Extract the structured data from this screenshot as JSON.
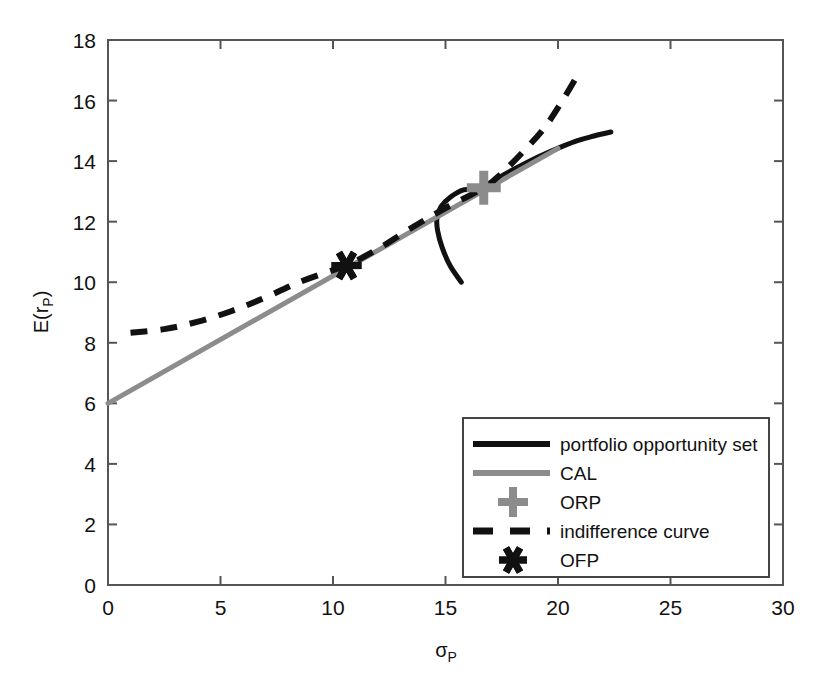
{
  "chart_data": {
    "type": "line",
    "title": "",
    "xlabel": "σP",
    "ylabel": "E(rP)",
    "xlim": [
      0,
      30
    ],
    "ylim": [
      0,
      18
    ],
    "xticks": [
      0,
      5,
      10,
      15,
      20,
      25,
      30
    ],
    "yticks": [
      0,
      2,
      4,
      6,
      8,
      10,
      12,
      14,
      16,
      18
    ],
    "xtick_labels": [
      "0",
      "5",
      "10",
      "15",
      "20",
      "25",
      "30"
    ],
    "ytick_labels": [
      "0",
      "2",
      "4",
      "6",
      "8",
      "10",
      "12",
      "14",
      "16",
      "18"
    ],
    "grid": false,
    "legend_position": "lower right",
    "colors": {
      "portfolio_opportunity_set": "#111111",
      "cal": "#8c8c8c",
      "orp": "#8c8c8c",
      "indifference_curve": "#111111",
      "ofp": "#111111",
      "axes": "#444444",
      "background": "#ffffff"
    },
    "series": [
      {
        "name": "portfolio opportunity set",
        "style": "solid",
        "color": "#111111",
        "points": [
          [
            15.7,
            10.0
          ],
          [
            15.2,
            10.55
          ],
          [
            14.85,
            11.15
          ],
          [
            14.65,
            11.7
          ],
          [
            14.62,
            12.12
          ],
          [
            14.8,
            12.5
          ],
          [
            15.2,
            12.8
          ],
          [
            15.8,
            13.05
          ],
          [
            16.7,
            13.12
          ],
          [
            17.6,
            13.55
          ],
          [
            18.6,
            13.95
          ],
          [
            19.7,
            14.33
          ],
          [
            20.8,
            14.66
          ],
          [
            21.6,
            14.83
          ],
          [
            22.35,
            14.96
          ]
        ]
      },
      {
        "name": "CAL",
        "style": "solid",
        "color": "#8c8c8c",
        "points": [
          [
            0.0,
            6.0
          ],
          [
            20.0,
            14.42
          ]
        ]
      },
      {
        "name": "indifference curve",
        "style": "dashed",
        "color": "#111111",
        "points": [
          [
            1.0,
            8.33
          ],
          [
            2.5,
            8.45
          ],
          [
            4.0,
            8.7
          ],
          [
            5.5,
            9.05
          ],
          [
            7.0,
            9.5
          ],
          [
            8.5,
            10.0
          ],
          [
            10.0,
            10.4
          ],
          [
            10.6,
            10.55
          ],
          [
            12.0,
            11.1
          ],
          [
            13.5,
            11.8
          ],
          [
            15.0,
            12.45
          ],
          [
            16.7,
            13.12
          ],
          [
            17.5,
            13.6
          ],
          [
            18.5,
            14.35
          ],
          [
            19.4,
            15.1
          ],
          [
            20.2,
            16.0
          ],
          [
            21.0,
            17.0
          ]
        ]
      }
    ],
    "markers": [
      {
        "name": "ORP",
        "symbol": "plus",
        "color": "#8c8c8c",
        "x": 16.7,
        "y": 13.12
      },
      {
        "name": "OFP",
        "symbol": "asterisk",
        "color": "#111111",
        "x": 10.6,
        "y": 10.55
      }
    ]
  },
  "legend": {
    "items": [
      {
        "label": "portfolio opportunity set",
        "kind": "line",
        "style": "solid",
        "color": "#111111"
      },
      {
        "label": "CAL",
        "kind": "line",
        "style": "solid",
        "color": "#8c8c8c"
      },
      {
        "label": "ORP",
        "kind": "marker",
        "style": "plus",
        "color": "#8c8c8c"
      },
      {
        "label": "indifference curve",
        "kind": "line",
        "style": "dashed",
        "color": "#111111"
      },
      {
        "label": "OFP",
        "kind": "marker",
        "style": "asterisk",
        "color": "#111111"
      }
    ]
  },
  "axis_labels": {
    "y_main": "E(r",
    "y_sub": "P",
    "y_close": ")",
    "x_main": "σ",
    "x_sub": "P"
  }
}
